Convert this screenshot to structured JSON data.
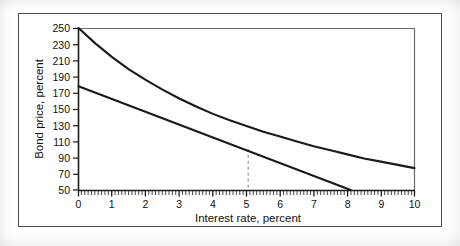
{
  "figure": {
    "background_color": "#ffffff",
    "frame_color": "#4a4a4a",
    "line_color": "#1a1a1a",
    "dashed_color": "#777777"
  },
  "chart_data": {
    "type": "line",
    "title": "",
    "xlabel": "Interest rate, percent",
    "ylabel": "Bond price, percent",
    "xlim": [
      0,
      10
    ],
    "ylim": [
      50,
      250
    ],
    "xticks": [
      0,
      1,
      2,
      3,
      4,
      5,
      6,
      7,
      8,
      9,
      10
    ],
    "xtick_labels": [
      "0",
      "1",
      "2",
      "3",
      "4",
      "5",
      "6",
      "7",
      "8",
      "9",
      "10"
    ],
    "yticks": [
      50,
      70,
      90,
      110,
      130,
      150,
      170,
      190,
      210,
      230,
      250
    ],
    "ytick_labels": [
      "50",
      "70",
      "90",
      "110",
      "130",
      "150",
      "170",
      "190",
      "210",
      "230",
      "250"
    ],
    "minor_xticks_per_interval": 10,
    "grid": false,
    "legend": null,
    "series": [
      {
        "name": "Bond price curve",
        "type": "curve",
        "x": [
          0,
          0.5,
          1,
          1.5,
          2,
          2.5,
          3,
          3.5,
          4,
          4.5,
          5,
          5.5,
          6,
          6.5,
          7,
          7.5,
          8,
          8.5,
          9,
          9.5,
          10
        ],
        "values": [
          250,
          231,
          214,
          199,
          186,
          174,
          163,
          153,
          144,
          136,
          129,
          122,
          116,
          110,
          104,
          99,
          94,
          89,
          85,
          81,
          77
        ]
      },
      {
        "name": "Tangent line",
        "type": "line",
        "x": [
          0,
          8.1
        ],
        "values": [
          178,
          50
        ]
      }
    ],
    "annotations": [
      {
        "name": "tangency-dropline",
        "type": "vertical-dashed",
        "x": 5.05,
        "y_from": 50,
        "y_to": 101
      }
    ]
  }
}
